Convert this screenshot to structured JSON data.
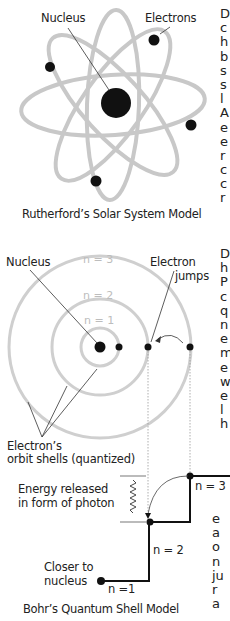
{
  "rutherford": {
    "label_nucleus": "Nucleus",
    "label_electrons": "Electrons",
    "caption": "Rutherford’s Solar System Model"
  },
  "bohr": {
    "label_nucleus": "Nucleus",
    "label_electron_jumps_1": "Electron",
    "label_electron_jumps_2": "jumps",
    "shell_n1": "n = 1",
    "shell_n2": "n = 2",
    "shell_n3": "n = 3",
    "label_orbit_1": "Electron’s",
    "label_orbit_2": "orbit shells (quantized)",
    "label_energy_1": "Energy released",
    "label_energy_2": "in form of photon",
    "level_n3": "n = 3",
    "level_n2": "n = 2",
    "level_n1": "n =1",
    "label_closer_1": "Closer to",
    "label_closer_2": "nucleus",
    "caption": "Bohr’s Quantum Shell Model"
  },
  "right_text_col1": [
    "D",
    "c",
    "h",
    "b",
    "s",
    "s",
    "l",
    "A",
    "e",
    "e",
    "r",
    "c",
    "c",
    "r"
  ],
  "right_text_col2": [
    "D",
    "h",
    "P",
    "c",
    "q",
    "n",
    "e",
    "m",
    "e",
    "w",
    "e",
    "l",
    "h"
  ],
  "right_text_col3": [
    "e",
    "a",
    "o",
    "n",
    "ju",
    "r",
    "a"
  ],
  "colors": {
    "orbit": "#c8c8c8",
    "ink": "#111111",
    "shell": "#cfcfcf"
  }
}
